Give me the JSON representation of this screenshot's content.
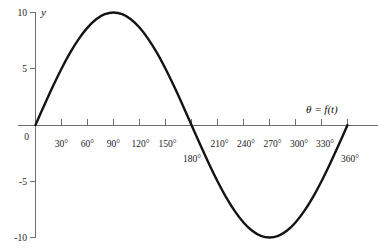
{
  "chart_data": {
    "type": "line",
    "title": "",
    "subtitle": "",
    "xlabel": "θ = f(t)",
    "ylabel": "y",
    "function": "y = 10 sin(θ)",
    "amplitude": 10,
    "grid": false,
    "legend": null,
    "xlim": [
      0,
      375
    ],
    "ylim": [
      -10,
      10
    ],
    "x_tick_labels": [
      "30°",
      "60°",
      "90°",
      "120°",
      "150°",
      "180°",
      "210°",
      "240°",
      "270°",
      "300°",
      "330°",
      "360°"
    ],
    "x_tick_values": [
      30,
      60,
      90,
      120,
      150,
      180,
      210,
      240,
      270,
      300,
      330,
      360
    ],
    "x_tick_offset_labels": [
      "180°",
      "360°"
    ],
    "y_tick_labels": [
      "10",
      "5",
      "0",
      "-5",
      "-10"
    ],
    "y_tick_values": [
      10,
      5,
      0,
      -5,
      -10
    ],
    "origin_label": "0",
    "x": [
      0,
      10,
      20,
      30,
      40,
      50,
      60,
      70,
      80,
      90,
      100,
      110,
      120,
      130,
      140,
      150,
      160,
      170,
      180,
      190,
      200,
      210,
      220,
      230,
      240,
      250,
      260,
      270,
      280,
      290,
      300,
      310,
      320,
      330,
      340,
      350,
      360
    ],
    "y": [
      0.0,
      1.74,
      3.42,
      5.0,
      6.43,
      7.66,
      8.66,
      9.4,
      9.85,
      10.0,
      9.85,
      9.4,
      8.66,
      7.66,
      6.43,
      5.0,
      3.42,
      1.74,
      0.0,
      -1.74,
      -3.42,
      -5.0,
      -6.43,
      -7.66,
      -8.66,
      -9.4,
      -9.85,
      -10.0,
      -9.85,
      -9.4,
      -8.66,
      -7.66,
      -6.43,
      -5.0,
      -3.42,
      -1.74,
      0.0
    ],
    "series": [
      {
        "name": "y = 10 sin(θ)",
        "values": [
          0.0,
          1.74,
          3.42,
          5.0,
          6.43,
          7.66,
          8.66,
          9.4,
          9.85,
          10.0,
          9.85,
          9.4,
          8.66,
          7.66,
          6.43,
          5.0,
          3.42,
          1.74,
          0.0,
          -1.74,
          -3.42,
          -5.0,
          -6.43,
          -7.66,
          -8.66,
          -9.4,
          -9.85,
          -10.0,
          -9.85,
          -9.4,
          -8.66,
          -7.66,
          -6.43,
          -5.0,
          -3.42,
          -1.74,
          0.0
        ]
      }
    ],
    "key_points": {
      "maximum": {
        "theta": 90,
        "y": 10
      },
      "minimum": {
        "theta": 270,
        "y": -10
      },
      "zero_crossings": [
        0,
        180,
        360
      ]
    },
    "colors": {
      "curve": "#141414",
      "axis": "#6e6e6e",
      "text": "#1a1a1a",
      "background": "#ffffff"
    }
  }
}
